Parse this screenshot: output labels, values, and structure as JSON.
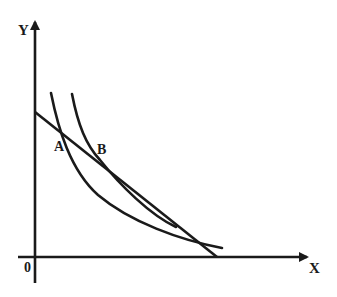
{
  "diagram": {
    "type": "indifference-curve-budget-line",
    "colors": {
      "ink": "#1a1a1a",
      "background": "#ffffff"
    },
    "axes": {
      "y_label": "Y",
      "x_label": "X",
      "origin_label": "0"
    },
    "points": [
      {
        "label": "A",
        "description": "intersection of budget line with inner indifference curve"
      },
      {
        "label": "B",
        "description": "tangency of budget line with outer indifference curve"
      }
    ],
    "elements": {
      "budget_line": "straight line from Y-axis to X-axis",
      "indifference_curves": 2
    }
  }
}
